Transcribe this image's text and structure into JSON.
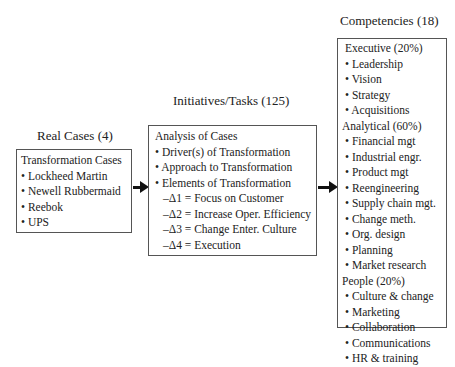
{
  "columns": [
    {
      "title": "Real Cases (4)",
      "lines": [
        "Transformation Cases",
        "• Lockheed Martin",
        "• Newell Rubbermaid",
        "• Reebok",
        "• UPS"
      ]
    },
    {
      "title": "Initiatives/Tasks (125)",
      "lines": [
        "Analysis of Cases",
        "• Driver(s) of Transformation",
        "• Approach to Transformation",
        "• Elements of Transformation",
        "  –Δ1 = Focus on Customer",
        "  –Δ2 = Increase Oper. Efficiency",
        "  –Δ3 = Change Enter. Culture",
        "  –Δ4 = Execution"
      ]
    },
    {
      "title": "Competencies (18)",
      "lines": [
        "Executive (20%)",
        "• Leadership",
        "• Vision",
        "• Strategy",
        "• Acquisitions",
        "Analytical (60%)",
        "• Financial mgt",
        "• Industrial engr.",
        "• Product mgt",
        "• Reengineering",
        "• Supply chain mgt.",
        "• Change meth.",
        "• Org. design",
        "• Planning",
        "• Market research",
        "People (20%)",
        "• Culture & change",
        "• Marketing",
        "• Collaboration",
        "• Communications",
        "• HR & training"
      ]
    }
  ]
}
